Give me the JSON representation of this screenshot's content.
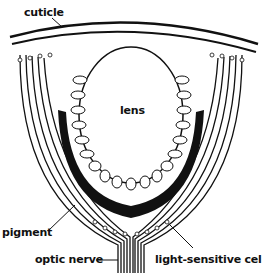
{
  "figure": {
    "labels": {
      "cuticle": "cuticle",
      "lens": "lens",
      "pigment": "pigment",
      "optic_nerve": "optic nerve",
      "light_sensitive_cells": "light-sensitive cells"
    },
    "colors": {
      "ink": "#111111",
      "background": "#ffffff"
    }
  }
}
